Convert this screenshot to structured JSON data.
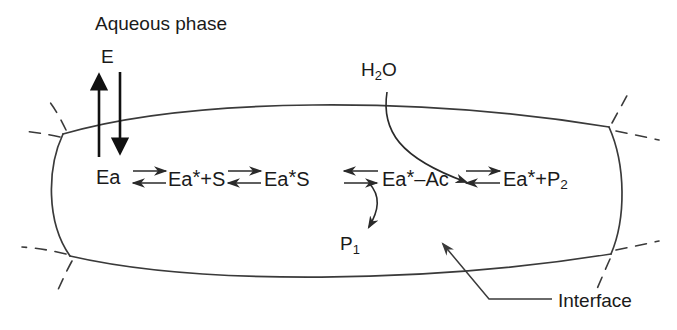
{
  "figure": {
    "type": "reaction-scheme-diagram",
    "background_color": "#ffffff",
    "stroke_color": "#3a3a3a",
    "text_color": "#1a1a1a"
  },
  "labels": {
    "aqueous_phase": "Aqueous phase",
    "enzyme": "E",
    "water": "H",
    "water_sub": "2",
    "water_tail": "O",
    "product1": "P",
    "product1_sub": "1",
    "interface": "Interface"
  },
  "scheme": {
    "species": [
      {
        "name": "enzyme-adsorbed",
        "text": "Ea"
      },
      {
        "name": "activated-enzyme-plus-substrate",
        "pre": "Ea",
        "star": "*",
        "post": "+S"
      },
      {
        "name": "activated-enzyme-substrate-complex",
        "pre": "Ea",
        "star": "*",
        "post": "S"
      },
      {
        "name": "acyl-enzyme",
        "pre": "Ea",
        "star": "*",
        "post": "–Ac"
      },
      {
        "name": "activated-enzyme-plus-product2",
        "pre": "Ea",
        "star": "*",
        "post": "+P",
        "sub": "2"
      }
    ],
    "equilibria_count": 4
  },
  "annotations": {
    "enzyme_exchange": "E partitions between aqueous phase and interface",
    "water_entry": "H2O adds to the acyl-enzyme step",
    "product1_release": "P1 released from Ea*S step",
    "interface_pointer": "Interface"
  }
}
